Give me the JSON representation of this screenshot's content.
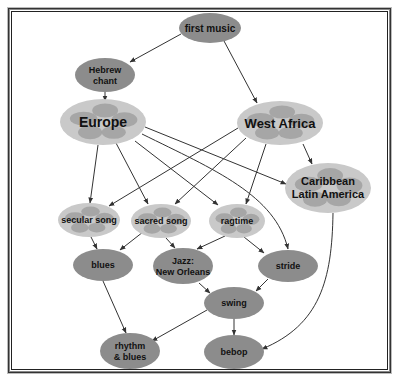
{
  "colors": {
    "node_dark": "#8c8c8c",
    "node_light": "#c9c9c9",
    "blob": "#9e9e9e",
    "edge": "#333333"
  },
  "nodes": [
    {
      "id": "first_music",
      "lines": [
        "first music"
      ],
      "cx": 210,
      "cy": 28,
      "rx": 31,
      "ry": 15,
      "style": "dark",
      "size": 10
    },
    {
      "id": "hebrew_chant",
      "lines": [
        "Hebrew",
        "chant"
      ],
      "cx": 105,
      "cy": 75,
      "rx": 30,
      "ry": 17,
      "style": "dark",
      "size": 9
    },
    {
      "id": "europe",
      "lines": [
        "Europe"
      ],
      "cx": 103,
      "cy": 122,
      "rx": 43,
      "ry": 23,
      "style": "light",
      "size": 14
    },
    {
      "id": "west_africa",
      "lines": [
        "West Africa"
      ],
      "cx": 280,
      "cy": 123,
      "rx": 43,
      "ry": 22,
      "style": "light",
      "size": 13
    },
    {
      "id": "caribbean",
      "lines": [
        "Caribbean",
        "Latin America"
      ],
      "cx": 328,
      "cy": 188,
      "rx": 43,
      "ry": 25,
      "style": "light",
      "size": 11
    },
    {
      "id": "secular_song",
      "lines": [
        "secular song"
      ],
      "cx": 89,
      "cy": 220,
      "rx": 31,
      "ry": 17,
      "style": "light",
      "size": 9
    },
    {
      "id": "sacred_song",
      "lines": [
        "sacred song"
      ],
      "cx": 161,
      "cy": 221,
      "rx": 30,
      "ry": 17,
      "style": "light",
      "size": 9
    },
    {
      "id": "ragtime",
      "lines": [
        "ragtime"
      ],
      "cx": 237,
      "cy": 221,
      "rx": 28,
      "ry": 17,
      "style": "light",
      "size": 9
    },
    {
      "id": "blues",
      "lines": [
        "blues"
      ],
      "cx": 103,
      "cy": 265,
      "rx": 30,
      "ry": 16,
      "style": "dark",
      "size": 9
    },
    {
      "id": "jazz_no",
      "lines": [
        "Jazz:",
        "New Orleans"
      ],
      "cx": 183,
      "cy": 266,
      "rx": 30,
      "ry": 18,
      "style": "dark",
      "size": 9
    },
    {
      "id": "stride",
      "lines": [
        "stride"
      ],
      "cx": 288,
      "cy": 266,
      "rx": 30,
      "ry": 16,
      "style": "dark",
      "size": 9
    },
    {
      "id": "swing",
      "lines": [
        "swing"
      ],
      "cx": 234,
      "cy": 303,
      "rx": 30,
      "ry": 16,
      "style": "dark",
      "size": 9
    },
    {
      "id": "rhythm_blues",
      "lines": [
        "rhythm",
        "& blues"
      ],
      "cx": 130,
      "cy": 351,
      "rx": 30,
      "ry": 18,
      "style": "dark",
      "size": 9
    },
    {
      "id": "bebop",
      "lines": [
        "bebop"
      ],
      "cx": 234,
      "cy": 352,
      "rx": 30,
      "ry": 17,
      "style": "dark",
      "size": 9
    }
  ],
  "edges": [
    {
      "from": "first_music",
      "to": "hebrew_chant",
      "path": "M181,34 L130,62"
    },
    {
      "from": "first_music",
      "to": "west_africa",
      "path": "M224,41 L257,103"
    },
    {
      "from": "hebrew_chant",
      "to": "europe",
      "path": "M105,92 L105,101"
    },
    {
      "from": "europe",
      "to": "secular_song",
      "path": "M98,145 L90,203"
    },
    {
      "from": "europe",
      "to": "sacred_song",
      "path": "M116,143 L148,204"
    },
    {
      "from": "europe",
      "to": "ragtime",
      "path": "M135,141 L218,205"
    },
    {
      "from": "europe",
      "to": "caribbean",
      "path": "M145,127 L286,184"
    },
    {
      "from": "europe",
      "to": "stride",
      "path": "M142,134 C215,170 275,195 288,249"
    },
    {
      "from": "west_africa",
      "to": "secular_song",
      "path": "M238,128 L109,206"
    },
    {
      "from": "west_africa",
      "to": "sacred_song",
      "path": "M246,138 L175,204"
    },
    {
      "from": "west_africa",
      "to": "ragtime",
      "path": "M266,144 L246,204"
    },
    {
      "from": "west_africa",
      "to": "caribbean",
      "path": "M303,144 L312,164"
    },
    {
      "from": "secular_song",
      "to": "blues",
      "path": "M91,237 L97,249"
    },
    {
      "from": "sacred_song",
      "to": "blues",
      "path": "M143,232 L120,250"
    },
    {
      "from": "sacred_song",
      "to": "jazz_no",
      "path": "M166,238 L175,248"
    },
    {
      "from": "ragtime",
      "to": "jazz_no",
      "path": "M225,236 L197,249"
    },
    {
      "from": "ragtime",
      "to": "stride",
      "path": "M244,237 L264,253"
    },
    {
      "from": "caribbean",
      "to": "bebop",
      "path": "M333,213 C332,280 320,325 262,349"
    },
    {
      "from": "blues",
      "to": "rhythm_blues",
      "path": "M103,281 L126,333"
    },
    {
      "from": "jazz_no",
      "to": "swing",
      "path": "M199,283 L210,293"
    },
    {
      "from": "stride",
      "to": "swing",
      "path": "M268,279 L256,291"
    },
    {
      "from": "swing",
      "to": "rhythm_blues",
      "path": "M207,310 L152,341"
    },
    {
      "from": "swing",
      "to": "bebop",
      "path": "M234,319 L234,335"
    }
  ]
}
